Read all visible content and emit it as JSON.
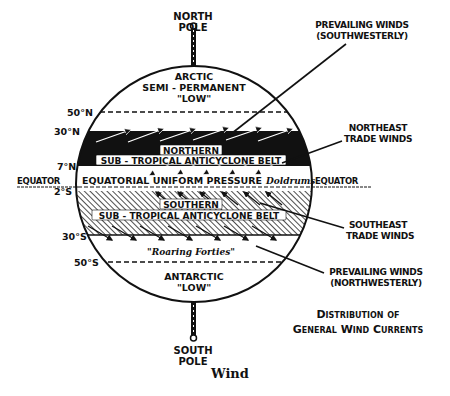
{
  "figure": {
    "title_line1": "Distribution of",
    "title_line2": "General Wind Currents",
    "caption": "Wind"
  },
  "poles": {
    "north": {
      "line1": "NORTH",
      "line2": "POLE"
    },
    "south": {
      "line1": "SOUTH",
      "line2": "POLE"
    }
  },
  "latitudes": {
    "n50": "50°N",
    "n30": "30°N",
    "n7": "7°N",
    "equator_left": "EQUATOR",
    "s2": "2°S",
    "s30": "30°S",
    "s50": "50°S",
    "equator_right": "EQUATOR"
  },
  "zones": {
    "arctic": {
      "line1": "ARCTIC",
      "line2": "SEMI - PERMANENT",
      "line3": "\"LOW\""
    },
    "northern_belt": {
      "line1": "NORTHERN",
      "line2": "SUB - TROPICAL ANTICYCLONE BELT"
    },
    "equatorial": {
      "label": "EQUATORIAL UNIFORM PRESSURE",
      "doldrums": "Doldrums"
    },
    "southern_belt": {
      "line1": "SOUTHERN",
      "line2": "SUB - TROPICAL ANTICYCLONE BELT"
    },
    "roaring_forties": "\"Roaring Forties\"",
    "antarctic": {
      "line1": "ANTARCTIC",
      "line2": "\"LOW\""
    }
  },
  "callouts": {
    "prevailing_sw": {
      "line1": "PREVAILING WINDS",
      "line2": "(SOUTHWESTERLY)"
    },
    "ne_trade": {
      "line1": "NORTHEAST",
      "line2": "TRADE WINDS"
    },
    "se_trade": {
      "line1": "SOUTHEAST",
      "line2": "TRADE WINDS"
    },
    "prevailing_nw": {
      "line1": "PREVAILING WINDS",
      "line2": "(NORTHWESTERLY)"
    }
  },
  "colors": {
    "ink": "#111111",
    "paper": "#ffffff"
  }
}
